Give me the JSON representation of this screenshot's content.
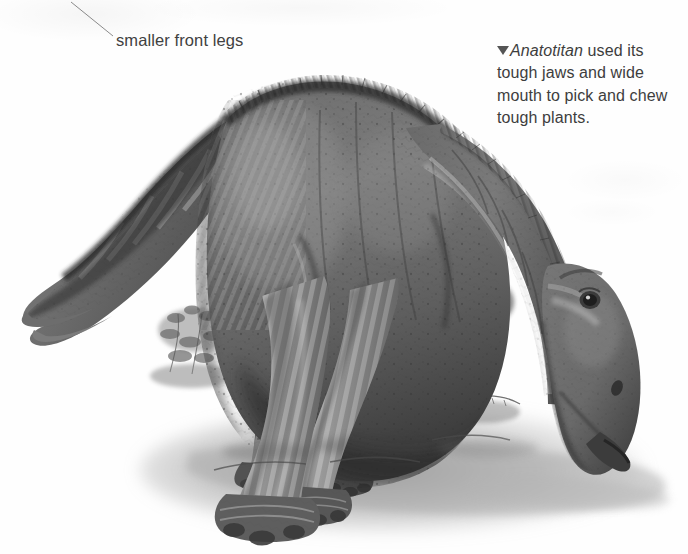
{
  "page": {
    "width": 688,
    "height": 554,
    "background_color": "#fefefe",
    "kind": "natural-image",
    "medium": "grayscale painted book illustration"
  },
  "annotations": {
    "front_legs_callout": {
      "text": "smaller front legs",
      "color": "#414141",
      "font_size_px": 16.5,
      "x": 116,
      "y": 30,
      "leader_line": {
        "from_x": 71,
        "from_y": 2,
        "to_x": 113,
        "to_y": 36,
        "color": "#8d8d8d",
        "width_px": 1
      }
    },
    "caption": {
      "marker_icon": "triangle-down-icon",
      "marker_color": "#555555",
      "genus": "Anatotitan",
      "genus_style": "italic",
      "rest": " used its tough jaws and wide mouth to pick and chew tough plants.",
      "full_text": "Anatotitan used its tough jaws and wide mouth to pick and chew tough plants.",
      "color": "#3d3d3d",
      "font_size_px": 16,
      "line_height_px": 22.3,
      "x": 497,
      "y": 40,
      "width_px": 178,
      "lines": [
        "Anatotitan used its",
        "tough jaws and wide",
        "mouth to pick and chew",
        "tough plants."
      ]
    }
  },
  "illustration": {
    "palette": {
      "deep_shadow": "#2b2b2b",
      "dark_hide": "#4a4a4a",
      "mid_hide": "#6f6f6f",
      "light_hide": "#9b9b9b",
      "highlight": "#cfcfcf",
      "pale_highlight": "#e6e6e6",
      "foliage_dark": "#555555",
      "foliage_mid": "#7d7d7d",
      "foliage_light": "#a8a8a8",
      "ground_wash": "#9a9a9a",
      "paper": "#fefefe"
    },
    "elements": [
      {
        "name": "tail",
        "note": "long tapering tail sweeping down and left, tip near lower-left"
      },
      {
        "name": "back-and-hips",
        "note": "high arched back with dark crested ridge running along spine"
      },
      {
        "name": "body-flank",
        "note": "speckled mottled hide with pale banding over the hips"
      },
      {
        "name": "neck",
        "note": "thick neck arcing down from shoulders to the right"
      },
      {
        "name": "head",
        "note": "low duck-billed head, eye visible, broad flat snout pointing down-right"
      },
      {
        "name": "front-leg-near",
        "note": "slender shorter foreleg with three-hoofed manus"
      },
      {
        "name": "front-leg-far",
        "note": "second foreleg behind the near one"
      },
      {
        "name": "hind-leg-near",
        "note": "heavy banded hind limb with broad three-toed foot"
      },
      {
        "name": "hind-leg-far",
        "note": "second hind limb set further back"
      },
      {
        "name": "fern-cluster",
        "note": "cycad/fern fronds in background between legs and head"
      },
      {
        "name": "shrub-cluster-left",
        "note": "small leafy scrub behind the forelegs"
      },
      {
        "name": "ground-shadow",
        "note": "soft grey cast shadow spreading to the lower right"
      }
    ]
  }
}
